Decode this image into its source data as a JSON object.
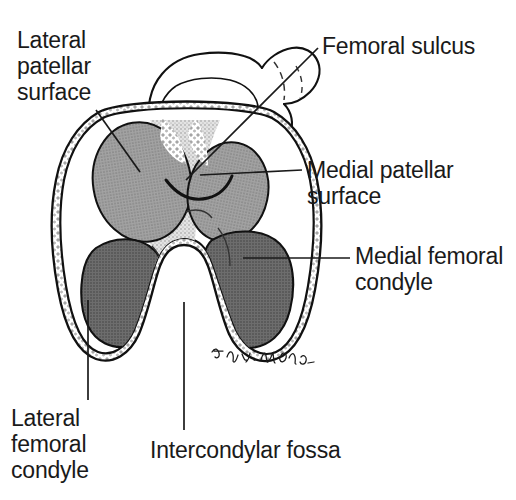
{
  "figure": {
    "signature": "Tony W. Malone",
    "colors": {
      "outline": "#111111",
      "patellar_surface_fill": "#9a9a9a",
      "condyle_fill": "#6e6e6e",
      "bone_fill": "#ffffff",
      "stipple_border": "#d8d8d8",
      "sulcus_fill": "#cfcfcf",
      "leader_line": "#1a1a1a",
      "text": "#1a1a1a",
      "background": "#ffffff"
    }
  },
  "labels": {
    "lateral_patellar_surface": "Lateral\npatellar\nsurface",
    "femoral_sulcus": "Femoral sulcus",
    "medial_patellar_surface": "Medial patellar\nsurface",
    "medial_femoral_condyle": "Medial femoral\ncondyle",
    "lateral_femoral_condyle": "Lateral\nfemoral\ncondyle",
    "intercondylar_fossa": "Intercondylar fossa"
  }
}
